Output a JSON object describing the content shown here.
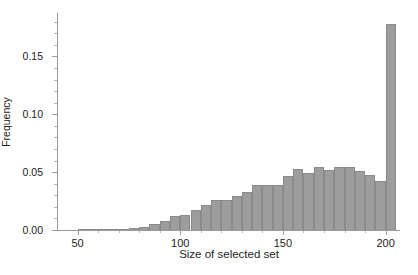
{
  "chart_data": {
    "type": "bar",
    "title": "",
    "xlabel": "Size of selected set",
    "ylabel": "Frequency",
    "xlim": [
      40,
      207
    ],
    "ylim": [
      0.0,
      0.1875
    ],
    "grid": false,
    "legend": null,
    "bin_width": 5,
    "x_ticks": [
      50,
      100,
      150,
      200
    ],
    "x_tick_labels": [
      "50",
      "100",
      "150",
      "200"
    ],
    "x_minor_ticks": [
      60,
      70,
      80,
      90,
      110,
      120,
      130,
      140,
      160,
      170,
      180,
      190
    ],
    "y_ticks": [
      0.0,
      0.05,
      0.1,
      0.15
    ],
    "y_tick_labels": [
      "0.00",
      "0.05",
      "0.10",
      "0.15"
    ],
    "y_minor_ticks": [
      0.01,
      0.02,
      0.03,
      0.04,
      0.06,
      0.07,
      0.08,
      0.09,
      0.11,
      0.12,
      0.13,
      0.14,
      0.16,
      0.17,
      0.18
    ],
    "bar_color": "#9d9d9d",
    "bar_edge_color": "#8a8a8a",
    "axis_color": "#9a9a9a",
    "text_color": "#1d1d1d",
    "bin_starts": [
      40,
      45,
      50,
      55,
      60,
      65,
      70,
      75,
      80,
      85,
      90,
      95,
      100,
      105,
      110,
      115,
      120,
      125,
      130,
      135,
      140,
      145,
      150,
      155,
      160,
      165,
      170,
      175,
      180,
      185,
      190,
      195,
      200
    ],
    "categories": [
      "40",
      "45",
      "50",
      "55",
      "60",
      "65",
      "70",
      "75",
      "80",
      "85",
      "90",
      "95",
      "100",
      "105",
      "110",
      "115",
      "120",
      "125",
      "130",
      "135",
      "140",
      "145",
      "150",
      "155",
      "160",
      "165",
      "170",
      "175",
      "180",
      "185",
      "190",
      "195",
      "200"
    ],
    "values": [
      0.0,
      0.0,
      0.0005,
      0.0005,
      0.0005,
      0.0008,
      0.001,
      0.0015,
      0.003,
      0.005,
      0.008,
      0.012,
      0.013,
      0.017,
      0.022,
      0.026,
      0.026,
      0.029,
      0.033,
      0.0385,
      0.039,
      0.039,
      0.047,
      0.0525,
      0.049,
      0.0545,
      0.0515,
      0.0545,
      0.0545,
      0.051,
      0.0475,
      0.042,
      0.178
    ]
  }
}
